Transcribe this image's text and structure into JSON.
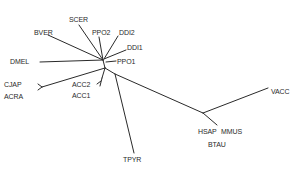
{
  "diagram": {
    "type": "unrooted-phylogenetic-tree",
    "line_color": "#2a2a2a",
    "text_color": "#2a2a2a",
    "background": "#ffffff",
    "taxa": [
      {
        "id": "scer",
        "label": "SCER",
        "x": 69,
        "y": 16
      },
      {
        "id": "bver",
        "label": "BVER",
        "x": 34,
        "y": 29
      },
      {
        "id": "ppo2",
        "label": "PPO2",
        "x": 92,
        "y": 29
      },
      {
        "id": "ddi2",
        "label": "DDI2",
        "x": 119,
        "y": 29
      },
      {
        "id": "ddi1",
        "label": "DDI1",
        "x": 127,
        "y": 44
      },
      {
        "id": "dmel",
        "label": "DMEL",
        "x": 10,
        "y": 58
      },
      {
        "id": "ppo1",
        "label": "PPO1",
        "x": 117,
        "y": 58
      },
      {
        "id": "cjap",
        "label": "CJAP",
        "x": 4,
        "y": 81
      },
      {
        "id": "acra",
        "label": "ACRA",
        "x": 4,
        "y": 93
      },
      {
        "id": "acc2",
        "label": "ACC2",
        "x": 72,
        "y": 81
      },
      {
        "id": "acc1",
        "label": "ACC1",
        "x": 72,
        "y": 92
      },
      {
        "id": "tpyr",
        "label": "TPYR",
        "x": 123,
        "y": 156
      },
      {
        "id": "vacc",
        "label": "VACC",
        "x": 271,
        "y": 88
      },
      {
        "id": "hsap",
        "label": "HSAP",
        "x": 198,
        "y": 128
      },
      {
        "id": "mmus",
        "label": "MMUS",
        "x": 221,
        "y": 128
      },
      {
        "id": "btau",
        "label": "BTAU",
        "x": 208,
        "y": 141
      }
    ],
    "branches": [
      {
        "from": [
          79,
          25
        ],
        "to": [
          103,
          60
        ]
      },
      {
        "from": [
          48,
          35
        ],
        "to": [
          103,
          60
        ]
      },
      {
        "from": [
          99,
          37
        ],
        "to": [
          103,
          60
        ]
      },
      {
        "from": [
          118,
          36
        ],
        "to": [
          104,
          59
        ]
      },
      {
        "from": [
          126,
          50
        ],
        "to": [
          104,
          59
        ]
      },
      {
        "from": [
          40,
          62
        ],
        "to": [
          103,
          60
        ]
      },
      {
        "from": [
          116,
          61
        ],
        "to": [
          106,
          62
        ]
      },
      {
        "from": [
          103,
          60
        ],
        "to": [
          105,
          68
        ]
      },
      {
        "from": [
          105,
          68
        ],
        "to": [
          42,
          87
        ]
      },
      {
        "from": [
          38,
          84
        ],
        "to": [
          42,
          87
        ]
      },
      {
        "from": [
          38,
          90
        ],
        "to": [
          42,
          87
        ]
      },
      {
        "from": [
          105,
          68
        ],
        "to": [
          102,
          78
        ]
      },
      {
        "from": [
          100,
          86
        ],
        "to": [
          102,
          78
        ]
      },
      {
        "from": [
          97,
          84
        ],
        "to": [
          101,
          81
        ]
      },
      {
        "from": [
          105,
          68
        ],
        "to": [
          115,
          74
        ]
      },
      {
        "from": [
          115,
          74
        ],
        "to": [
          134,
          153
        ]
      },
      {
        "from": [
          115,
          74
        ],
        "to": [
          203,
          113
        ]
      },
      {
        "from": [
          203,
          113
        ],
        "to": [
          268,
          88
        ]
      },
      {
        "from": [
          203,
          113
        ],
        "to": [
          217,
          125
        ]
      }
    ]
  }
}
